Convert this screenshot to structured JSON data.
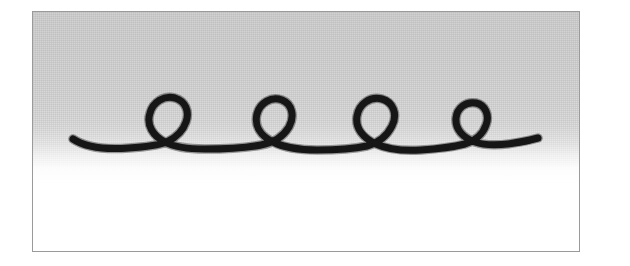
{
  "figure": {
    "title": "Looped cursive stroke exercise",
    "medium": "ink drawing on paper, scanned halftone",
    "frame": {
      "border_color": "#9a9a9a",
      "border_width_px": 1,
      "x": 32,
      "y": 11,
      "width": 548,
      "height": 241
    },
    "paper": {
      "top_tone_color": "#d2d2d2",
      "bottom_tone_color": "#ffffff",
      "gradient_direction": "top-to-bottom",
      "grain": "halftone dither"
    },
    "ink": {
      "color": "#161616",
      "stroke_width_px": 7,
      "line_cap": "round"
    }
  },
  "chart_data": {
    "type": "line",
    "title": "Looped cursive stroke exercise",
    "xlabel": "",
    "ylabel": "",
    "xlim": [
      0,
      548
    ],
    "ylim": [
      0,
      241
    ],
    "grid": false,
    "legend": null,
    "annotations": [],
    "series": [
      {
        "name": "ink-stroke",
        "color": "#161616",
        "stroke_width": 7,
        "loop_count": 4,
        "baseline_y": 133,
        "start_point": [
          40,
          127
        ],
        "end_point": [
          505,
          126
        ],
        "loops": [
          {
            "index": 1,
            "center_x": 138,
            "center_y": 111,
            "radius_x": 22,
            "radius_y": 23,
            "shape": "round"
          },
          {
            "index": 2,
            "center_x": 240,
            "center_y": 108,
            "radius_x": 21,
            "radius_y": 24,
            "shape": "teardrop"
          },
          {
            "index": 3,
            "center_x": 353,
            "center_y": 110,
            "radius_x": 23,
            "radius_y": 24,
            "shape": "round"
          },
          {
            "index": 4,
            "center_x": 446,
            "center_y": 112,
            "radius_x": 20,
            "radius_y": 21,
            "shape": "round"
          }
        ],
        "path_d": "M 40 127 C 52 135, 70 138, 96 136 C 112 135, 126 133, 134 130 C 142 126, 150 119, 153 110 C 157 99, 152 89, 142 86 C 131 83, 120 90, 117 101 C 113 113, 120 124, 132 130 C 143 136, 158 137, 172 137 C 192 137, 212 136, 228 133 C 240 131, 250 125, 256 115 C 262 104, 259 92, 249 88 C 238 84, 227 91, 224 102 C 221 114, 228 124, 240 130 C 252 136, 268 138, 284 138 C 302 138, 320 137, 334 134 C 345 131, 354 124, 359 114 C 365 102, 360 90, 349 87 C 337 84, 326 92, 324 104 C 322 116, 330 126, 343 132 C 356 138, 372 139, 388 138 C 404 137, 420 135, 432 132 C 442 129, 450 122, 453 113 C 457 103, 452 93, 443 91 C 433 89, 424 96, 423 106 C 422 117, 430 126, 442 130 C 456 135, 478 133, 505 126"
      }
    ]
  }
}
